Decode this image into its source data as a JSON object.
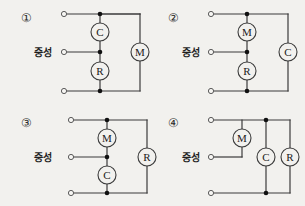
{
  "figure": {
    "background_color": "#f2f1ee",
    "wire_color": "#3b3b3b",
    "junction_color": "#111111",
    "terminal_fill": "#f7f6f3",
    "neutral_label": "중성"
  },
  "options": [
    {
      "id": "option-1",
      "marker": "①",
      "neutral_label": "중성",
      "center_branch": {
        "upper_component": "C",
        "lower_component": "R"
      },
      "right_branch": {
        "component": "M",
        "spans": "top-to-bottom"
      },
      "components": [
        "C",
        "R",
        "M"
      ]
    },
    {
      "id": "option-2",
      "marker": "②",
      "neutral_label": "중성",
      "center_branch": {
        "upper_component": "M",
        "lower_component": "R"
      },
      "right_branch": {
        "component": "C",
        "spans": "top-to-bottom"
      },
      "components": [
        "M",
        "R",
        "C"
      ]
    },
    {
      "id": "option-3",
      "marker": "③",
      "neutral_label": "중성",
      "center_branch": {
        "upper_component": "M",
        "lower_component": "C"
      },
      "right_branch": {
        "component": "R",
        "spans": "top-to-bottom"
      },
      "components": [
        "M",
        "C",
        "R"
      ]
    },
    {
      "id": "option-4",
      "marker": "④",
      "neutral_label": "중성",
      "hanging_branch": {
        "component": "M",
        "spans": "top-to-neutral"
      },
      "parallel_branches": [
        {
          "component": "C",
          "spans": "top-to-bottom"
        },
        {
          "component": "R",
          "spans": "top-to-bottom"
        }
      ],
      "components": [
        "M",
        "C",
        "R"
      ]
    }
  ]
}
